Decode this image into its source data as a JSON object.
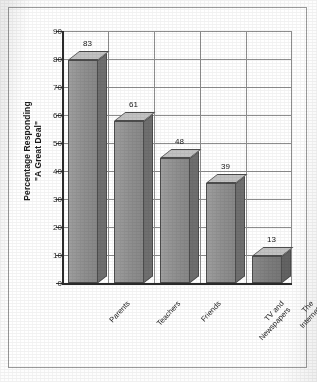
{
  "chart_data": {
    "type": "bar",
    "title": "",
    "subtitle": "",
    "xlabel": "",
    "ylabel": "Percentage Responding \"A Great Deal\"",
    "ylabel_lines": [
      "Percentage Responding",
      "\"A Great Deal\""
    ],
    "categories": [
      "Parents",
      "Teachers",
      "Friends",
      "TV and Newspapers",
      "The Internet"
    ],
    "category_lines": [
      [
        "Parents"
      ],
      [
        "Teachers"
      ],
      [
        "Friends"
      ],
      [
        "TV and",
        "Newspapers"
      ],
      [
        "The",
        "Internet"
      ]
    ],
    "values": [
      83,
      61,
      48,
      39,
      13
    ],
    "ylim": [
      0,
      90
    ],
    "ytick_step": 10,
    "yticks": [
      90,
      80,
      70,
      60,
      50,
      40,
      30,
      20,
      10,
      0
    ],
    "grid": "horizontal-and-vertical",
    "legend": "none",
    "style": "3d-columns-grayscale",
    "data_labels_shown": true
  },
  "colors": {
    "bar_front": "#8f8f8f",
    "bar_top": "#c2c2c2",
    "bar_side": "#6f6f6f",
    "bar_outline": "#4d4d4d",
    "gridline": "#8e8e8e",
    "axis": "#2a2a2a",
    "text": "#1a1a1a",
    "frame": "#9a9a9a",
    "background": "#ffffff"
  }
}
